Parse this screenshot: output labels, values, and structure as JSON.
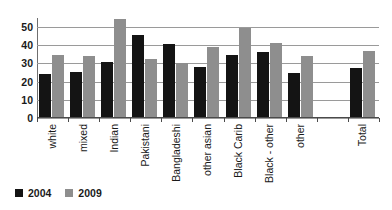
{
  "chart_data": {
    "type": "bar",
    "title": "",
    "subtitle": "",
    "xlabel": "",
    "ylabel": "",
    "ylim": [
      0,
      55
    ],
    "yticks": [
      0,
      10,
      20,
      30,
      40,
      50
    ],
    "grid": true,
    "grid_axis": "y",
    "legend_position": "bottom-left",
    "categories": [
      "white",
      "mixed",
      "Indian",
      "Pakistani",
      "Bangladeshi",
      "other asian",
      "Black Carib",
      "Black - other",
      "other",
      "",
      "Total"
    ],
    "series": [
      {
        "name": "2004",
        "color": "#141414",
        "values": [
          23.5,
          24.8,
          30.0,
          45.0,
          40.0,
          27.5,
          34.0,
          35.5,
          24.0,
          null,
          27.0
        ]
      },
      {
        "name": "2009",
        "color": "#8e8e8e",
        "values": [
          34.2,
          33.7,
          54.0,
          32.0,
          29.5,
          38.5,
          49.2,
          40.5,
          33.4,
          null,
          36.5
        ]
      }
    ]
  },
  "legend": {
    "entries": [
      {
        "label": "2004",
        "color": "#141414"
      },
      {
        "label": "2009",
        "color": "#8e8e8e"
      }
    ]
  }
}
